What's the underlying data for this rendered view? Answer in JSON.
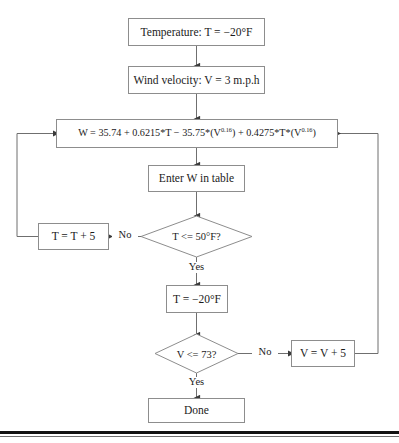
{
  "diagram": {
    "colors": {
      "box_border": "#8d8d8d",
      "connector": "#6f6f6f",
      "text": "#1b1b1b",
      "background": "#ffffff",
      "bottom_rule": "#121212"
    },
    "nodes": {
      "temperature": {
        "label": "Temperature: T = −20°F",
        "shape": "process"
      },
      "wind_velocity": {
        "label": "Wind velocity: V = 3 m.p.h",
        "shape": "process"
      },
      "formula": {
        "label_prefix": "W = 35.74 + 0.6215*T − 35.75*(V",
        "exponent_1": "0.16",
        "label_middle": ") + 0.4275*T*(V",
        "exponent_2": "0.16",
        "label_suffix": ")",
        "shape": "process"
      },
      "enter_table": {
        "label": "Enter W in table",
        "shape": "process"
      },
      "temp_decision": {
        "label": "T <= 50°F?",
        "shape": "decision"
      },
      "increment_t": {
        "label": "T = T + 5",
        "shape": "process"
      },
      "reset_t": {
        "label": "T = −20°F",
        "shape": "process"
      },
      "velocity_decision": {
        "label": "V <= 73?",
        "shape": "decision"
      },
      "increment_v": {
        "label": "V = V + 5",
        "shape": "process"
      },
      "done": {
        "label": "Done",
        "shape": "terminal"
      }
    },
    "edge_labels": {
      "temp_no": "No",
      "temp_yes": "Yes",
      "velocity_no": "No",
      "velocity_yes": "Yes"
    }
  }
}
